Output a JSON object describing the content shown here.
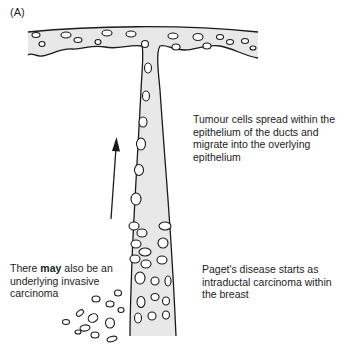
{
  "figure": {
    "panel_label": "(A)",
    "colors": {
      "duct_fill": "#e8e8e8",
      "outline": "#1a1a1a",
      "background": "#ffffff"
    }
  },
  "labels": {
    "spread": "Tumour cells spread within the epithelium of the ducts and migrate into the overlying epithelium",
    "paget": "Paget's disease starts as intraductal carcinoma within the breast",
    "invasive_pre": "There ",
    "invasive_bold": "may",
    "invasive_post": " also be an underlying invasive carcinoma"
  },
  "arrow": {
    "direction": "up",
    "meaning": "upward migration of tumour cells"
  }
}
